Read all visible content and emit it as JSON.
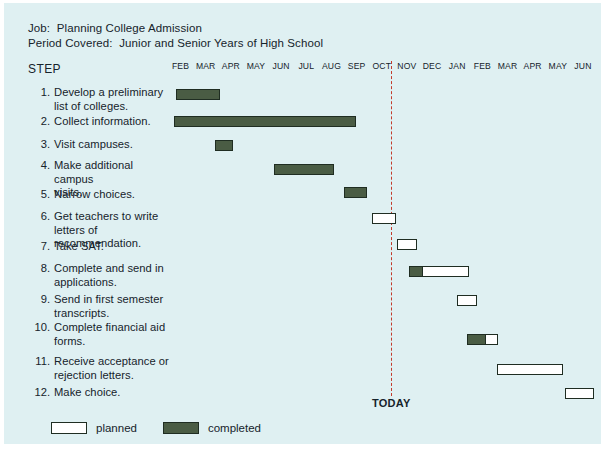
{
  "chart_data": {
    "type": "bar",
    "subtype": "gantt",
    "title": "Planning College Admission",
    "xlabel": "",
    "ylabel": "STEP",
    "grid": false,
    "legend_position": "bottom-left",
    "categories": [
      "1. Develop a preliminary list of colleges.",
      "2. Collect information.",
      "3. Visit campuses.",
      "4. Make additional campus visits.",
      "5. Narrow choices.",
      "6. Get teachers to write letters of recommendation.",
      "7. Take SAT.",
      "8. Complete and send in applications.",
      "9. Send in first semester transcripts.",
      "10. Complete financial aid forms.",
      "11. Receive acceptance or rejection letters.",
      "12. Make choice."
    ],
    "x": [
      "FEB",
      "MAR",
      "APR",
      "MAY",
      "JUN",
      "JUL",
      "AUG",
      "SEP",
      "OCT",
      "NOV",
      "DEC",
      "JAN",
      "FEB",
      "MAR",
      "APR",
      "MAY",
      "JUN"
    ],
    "series": [
      {
        "name": "completed",
        "color": "#4a5c44"
      },
      {
        "name": "planned",
        "color": "#ffffff"
      }
    ],
    "annotations": [
      {
        "label": "TODAY",
        "x": "OCT/NOV boundary",
        "month_index": 9,
        "style": "red dashed vertical line"
      }
    ],
    "values": [
      {
        "step": 1,
        "start_month": "FEB",
        "end_month": "MAR",
        "completed_months": 1.7,
        "planned_months": 0
      },
      {
        "step": 2,
        "start_month": "FEB",
        "end_month": "SEP",
        "completed_months": 7.2,
        "planned_months": 0
      },
      {
        "step": 3,
        "start_month": "APR",
        "end_month": "APR",
        "completed_months": 0.7,
        "planned_months": 0
      },
      {
        "step": 4,
        "start_month": "JUN",
        "end_month": "AUG",
        "completed_months": 2.4,
        "planned_months": 0
      },
      {
        "step": 5,
        "start_month": "SEP",
        "end_month": "SEP",
        "completed_months": 0.9,
        "planned_months": 0
      },
      {
        "step": 6,
        "start_month": "OCT",
        "end_month": "OCT",
        "completed_months": 0,
        "planned_months": 1.0
      },
      {
        "step": 7,
        "start_month": "NOV",
        "end_month": "NOV",
        "completed_months": 0,
        "planned_months": 0.8
      },
      {
        "step": 8,
        "start_month": "NOV",
        "end_month": "DEC",
        "completed_months": 0.5,
        "planned_months": 1.9
      },
      {
        "step": 9,
        "start_month": "JAN",
        "end_month": "JAN",
        "completed_months": 0,
        "planned_months": 0.8
      },
      {
        "step": 10,
        "start_month": "FEB",
        "end_month": "FEB",
        "completed_months": 0.75,
        "planned_months": 0.45
      },
      {
        "step": 11,
        "start_month": "MAR",
        "end_month": "MAY",
        "completed_months": 0,
        "planned_months": 2.6
      },
      {
        "step": 12,
        "start_month": "JUN",
        "end_month": "JUN",
        "completed_months": 0,
        "planned_months": 1.1
      }
    ]
  },
  "header": {
    "job_line": "Job:  Planning College Admission",
    "period_line": "Period Covered:  Junior and Senior Years of High School",
    "step_column_title": "STEP"
  },
  "months": [
    "FEB",
    "MAR",
    "APR",
    "MAY",
    "JUN",
    "JUL",
    "AUG",
    "SEP",
    "OCT",
    "NOV",
    "DEC",
    "JAN",
    "FEB",
    "MAR",
    "APR",
    "MAY",
    "JUN"
  ],
  "today": {
    "label": "TODAY"
  },
  "steps": [
    {
      "num": "1.",
      "text": "Develop a preliminary\nlist of colleges."
    },
    {
      "num": "2.",
      "text": "Collect information."
    },
    {
      "num": "3.",
      "text": "Visit campuses."
    },
    {
      "num": "4.",
      "text": "Make additional campus\nvisits."
    },
    {
      "num": "5.",
      "text": "Narrow choices."
    },
    {
      "num": "6.",
      "text": "Get teachers to write\nletters of recommendation."
    },
    {
      "num": "7.",
      "text": "Take SAT."
    },
    {
      "num": "8.",
      "text": "Complete and send in\napplications."
    },
    {
      "num": "9.",
      "text": "Send in first semester\ntranscripts."
    },
    {
      "num": "10.",
      "text": "Complete financial aid\nforms."
    },
    {
      "num": "11.",
      "text": "Receive acceptance or\nrejection letters."
    },
    {
      "num": "12.",
      "text": "Make choice."
    }
  ],
  "legend": {
    "planned_label": "planned",
    "completed_label": "completed"
  },
  "colors": {
    "background": "#dff0f2",
    "completed": "#4a5c44",
    "planned": "#ffffff",
    "bar_border": "#1f2d22",
    "today_line": "#c23a2b",
    "text": "#16232b"
  }
}
